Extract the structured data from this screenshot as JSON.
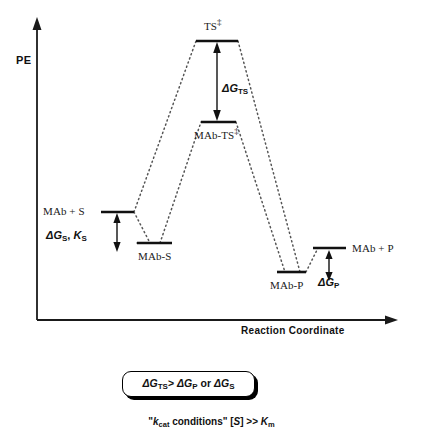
{
  "figure": {
    "type": "reaction-coordinate-energy-diagram",
    "axes": {
      "y_label": "PE",
      "x_label": "Reaction Coordinate"
    },
    "levels": [
      {
        "key": "mab_s",
        "label": "MAb + S",
        "label_position": "left",
        "x1": 101,
        "x2": 134,
        "y": 212
      },
      {
        "key": "mab_s_complex",
        "label": "MAb-S",
        "label_position": "below",
        "x1": 137,
        "x2": 172,
        "y": 243
      },
      {
        "key": "ts",
        "label": "TS",
        "dagger": true,
        "label_position": "above",
        "x1": 196,
        "x2": 238,
        "y": 41
      },
      {
        "key": "mab_ts",
        "label": "MAb-TS",
        "dagger": true,
        "label_position": "below",
        "x1": 201,
        "x2": 236,
        "y": 122
      },
      {
        "key": "mab_p_complex",
        "label": "MAb-P",
        "label_position": "below",
        "x1": 277,
        "x2": 306,
        "y": 272
      },
      {
        "key": "mab_p",
        "label": "MAb + P",
        "label_position": "right",
        "x1": 313,
        "x2": 346,
        "y": 248
      }
    ],
    "energy_gaps": [
      {
        "key": "dG_TS",
        "symbol": "ΔG",
        "subscript": "TS",
        "x": 217,
        "y_top": 44,
        "y_bottom": 120
      },
      {
        "key": "dG_S",
        "symbol": "ΔG",
        "subscript": "S",
        "extra": "K",
        "extra_subscript": "S",
        "x": 117,
        "y_top": 215,
        "y_bottom": 251
      },
      {
        "key": "dG_P",
        "symbol": "ΔG",
        "subscript": "P",
        "x": 329,
        "y_top": 251,
        "y_bottom": 280
      }
    ],
    "labels": {
      "ts": "TS",
      "mab_ts": "MAb-TS",
      "mab_s_sum": "MAb + S",
      "mab_s_complex": "MAb-S",
      "mab_p_complex": "MAb-P",
      "mab_p_sum": "MAb + P",
      "dagger": "‡"
    },
    "delta_labels": {
      "dG_TS": {
        "delta": "Δ",
        "G": "G",
        "sub": "TS"
      },
      "dG_S": {
        "delta": "Δ",
        "G": "G",
        "sub": "S",
        "comma": ", ",
        "K": "K",
        "k_sub": "S"
      },
      "dG_P": {
        "delta": "Δ",
        "G": "G",
        "sub": "P"
      }
    },
    "callout": {
      "delta1": "Δ",
      "G1": "G",
      "sub1": "TS",
      "operator": ">",
      "delta2": "Δ",
      "G2": "G",
      "sub2": "P",
      "conjunction": " or ",
      "delta3": "Δ",
      "G3": "G",
      "sub3": "S"
    },
    "caption": {
      "quote_open": "\"",
      "k": "k",
      "k_sub": "cat",
      "conditions": " conditions\" [",
      "S": "S",
      "middle": "] >> ",
      "K": "K",
      "K_sub": "m"
    },
    "colors": {
      "line": "#1a1a1a",
      "dotted": "#555555",
      "background": "#ffffff",
      "text": "#111111"
    }
  }
}
